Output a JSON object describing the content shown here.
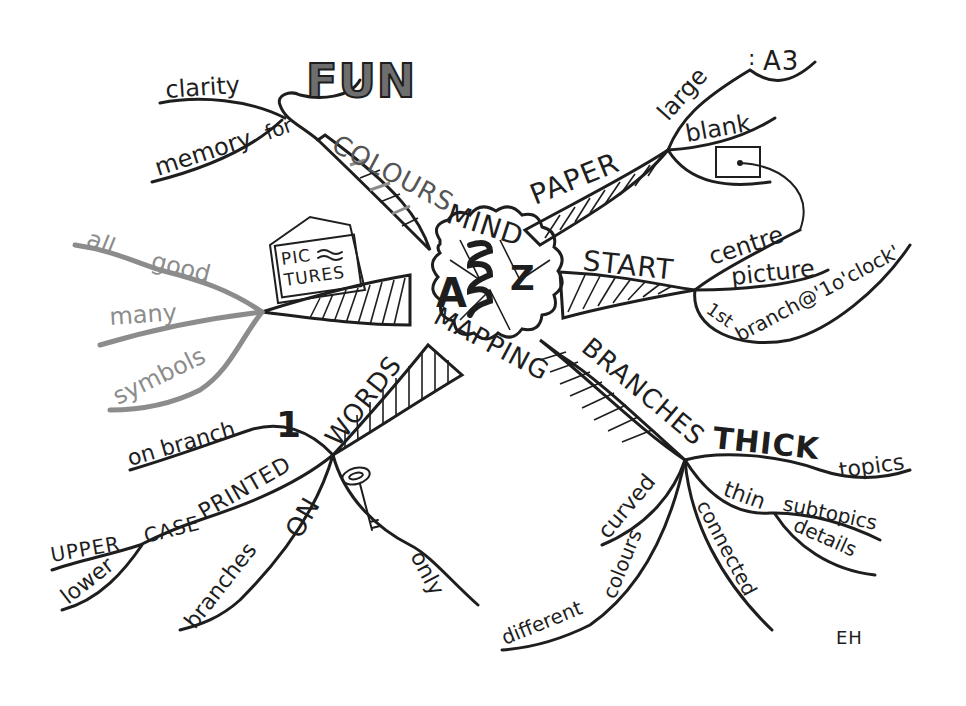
{
  "colors": {
    "ink": "#1e1e1e",
    "grey_branch": "#8c8c8c",
    "fun_fill": "#6e6e6e",
    "background": "#ffffff"
  },
  "centre": {
    "line1": "A",
    "line2": "Z",
    "top_word": "MIND",
    "bottom_word": "MAPPING",
    "zigzag_letter": "S"
  },
  "branches": {
    "colours": {
      "label": "COLOURS",
      "subs": {
        "for": "for",
        "clarity": "clarity",
        "memory": "memory",
        "fun": "FUN"
      }
    },
    "paper": {
      "label": "PAPER",
      "subs": {
        "large": "large",
        "colon": ":",
        "a3": "A3",
        "blank": "blank"
      }
    },
    "start": {
      "label": "START",
      "subs": {
        "centre": "centre",
        "picture": "picture",
        "first": "1st",
        "branch_clock": "branch@'1o'clock'"
      }
    },
    "pictures": {
      "label_line1": "PIC",
      "label_line2": "TURES",
      "subs": {
        "all": "all",
        "good": "good",
        "many": "many",
        "symbols": "symbols"
      }
    },
    "words": {
      "label": "WORDS",
      "subs": {
        "one": "1",
        "on_branch": "on branch",
        "printed": "PRINTED",
        "case": "CASE",
        "upper": "UPPER",
        "lower": "lower",
        "on": "ON",
        "branches": "branches",
        "only": "only"
      }
    },
    "branches": {
      "label": "BRANCHES",
      "subs": {
        "thick": "THICK",
        "topics": "topics",
        "thin": "thin",
        "subtopics": "subtopics",
        "details": "details",
        "curved": "curved",
        "colours": "colours",
        "different": "different",
        "connected": "connected"
      }
    }
  },
  "signature": "EH"
}
